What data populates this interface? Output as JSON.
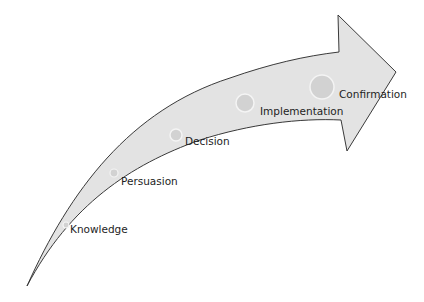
{
  "diagram": {
    "type": "curved-arrow-process",
    "colors": {
      "arrow_fill": "#e3e3e3",
      "arrow_stroke": "#3a3a3a",
      "marker_fill": "#d2d2d2",
      "marker_stroke": "#f4f4f4",
      "text": "#1e1e1e"
    },
    "stages": [
      {
        "label": "Knowledge"
      },
      {
        "label": "Persuasion"
      },
      {
        "label": "Decision"
      },
      {
        "label": "Implementation"
      },
      {
        "label": "Confirmation"
      }
    ]
  }
}
